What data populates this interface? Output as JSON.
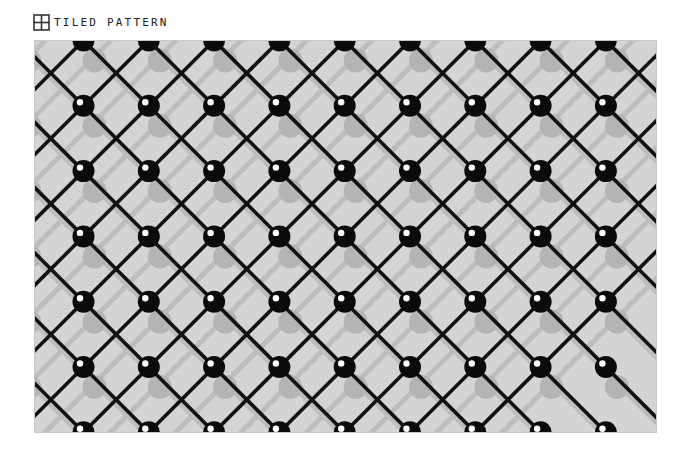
{
  "header": {
    "icon": "grid-square-icon",
    "title": "TILED PATTERN"
  },
  "pattern": {
    "type": "diagonal lattice with spheres",
    "background_color": "#d4d4d4",
    "line_color": "#111111",
    "shadow_line_color": "#bdbdbd",
    "ball_color": "#0b0b0b",
    "highlight_color": "#ffffff",
    "shadow_color": "#b4b4b4",
    "spacing": 65.3,
    "columns": 9,
    "rows": 7
  }
}
